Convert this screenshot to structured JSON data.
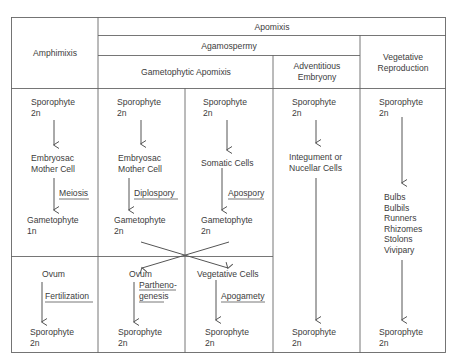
{
  "headers": {
    "amphimixis": "Amphimixis",
    "apomixis": "Apomixis",
    "agamospermy": "Agamospermy",
    "gametophytic_apomixis": "Gametophytic Apomixis",
    "adventitious_embryony": [
      "Adventitious",
      "Embryony"
    ],
    "vegetative_reproduction": [
      "Vegetative",
      "Reproduction"
    ]
  },
  "columns": {
    "amphimixis": {
      "start": [
        "Sporophyte",
        "2n"
      ],
      "mid": [
        "Embryosac",
        "Mother Cell"
      ],
      "process1": "Meiosis",
      "gametophyte": [
        "Gametophyte",
        "1n"
      ],
      "lower_start": "Ovum",
      "process2": "Fertilization",
      "end": [
        "Sporophyte",
        "2n"
      ]
    },
    "diplospory": {
      "start": [
        "Sporophyte",
        "2n"
      ],
      "mid": [
        "Embryosac",
        "Mother Cell"
      ],
      "process1": "Diplospory",
      "gametophyte": [
        "Gametophyte",
        "2n"
      ],
      "lower_start": "Ovum",
      "process2": [
        "Partheno-",
        "genesis"
      ],
      "end": [
        "Sporophyte",
        "2n"
      ]
    },
    "apospory": {
      "start": [
        "Sporophyte",
        "2n"
      ],
      "mid": "Somatic Cells",
      "process1": "Apospory",
      "gametophyte": [
        "Gametophyte",
        "2n"
      ],
      "lower_start": "Vegetative Cells",
      "process2": "Apogamety",
      "end": [
        "Sporophyte",
        "2n"
      ]
    },
    "adventitious": {
      "start": [
        "Sporophyte",
        "2n"
      ],
      "mid": [
        "Integument or",
        "Nucellar Cells"
      ],
      "end": [
        "Sporophyte",
        "2n"
      ]
    },
    "vegetative": {
      "start": [
        "Sporophyte",
        "2n"
      ],
      "organs": [
        "Bulbs",
        "Bulbils",
        "Runners",
        "Rhizomes",
        "Stolons",
        "Vivipary"
      ],
      "end": [
        "Sporophyte",
        "2n"
      ]
    }
  },
  "colors": {
    "line": "#5a5a5a",
    "text": "#3c3c3c",
    "background": "#ffffff"
  }
}
